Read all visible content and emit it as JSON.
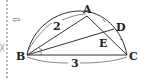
{
  "figure": {
    "points": {
      "A": "A",
      "B": "B",
      "C": "C",
      "D": "D",
      "E": "E"
    },
    "lengths": {
      "BA": "2",
      "BC": "3"
    },
    "margin": {
      "arrow_icon": "⇦",
      "small_mark": "╳"
    },
    "colors": {
      "ink": "#222222",
      "dash": "#888888"
    }
  }
}
